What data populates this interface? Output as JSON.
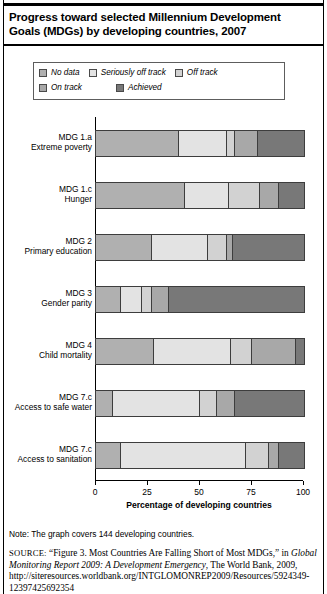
{
  "title": "Progress toward selected Millennium Development Goals (MDGs) by developing countries, 2007",
  "legend": {
    "items": [
      {
        "label": "No data",
        "color": "#b0b0b0"
      },
      {
        "label": "Seriously off track",
        "color": "#e3e3e3"
      },
      {
        "label": "Off track",
        "color": "#d2d2d2"
      },
      {
        "label": "On track",
        "color": "#a8a8a8"
      },
      {
        "label": "Achieved",
        "color": "#787878"
      }
    ]
  },
  "note": "Note: The graph covers 144 developing countries.",
  "source": {
    "prefix": "SOURCE:",
    "quote": "“Figure 3. Most Countries Are Falling Short of Most MDGs,” in ",
    "italic": "Global Monitoring Report 2009: A Development Emergency",
    "tail": ", The World Bank, 2009, http://siteresources.worldbank.org/INTGLOMONREP2009/Resources/5924349-12397425692354"
  },
  "chart_data": {
    "type": "bar",
    "orientation": "horizontal",
    "stacked": true,
    "stack_mode": "percent",
    "title": "Progress toward selected Millennium Development Goals (MDGs) by developing countries, 2007",
    "xlabel": "Percentage of developing countries",
    "ylabel": "",
    "xlim": [
      0,
      100
    ],
    "xticks": [
      0,
      25,
      50,
      75,
      100
    ],
    "grid": false,
    "legend_position": "top",
    "categories": [
      "MDG 1.a\nExtreme poverty",
      "MDG 1.c\nHunger",
      "MDG 2\nPrimary education",
      "MDG 3\nGender parity",
      "MDG 4\nChild mortality",
      "MDG 7.c\nAccess to safe water",
      "MDG 7.c\nAccess to sanitation"
    ],
    "category_lines": [
      [
        "MDG 1.a",
        "Extreme poverty"
      ],
      [
        "MDG 1.c",
        "Hunger"
      ],
      [
        "MDG 2",
        "Primary education"
      ],
      [
        "MDG 3",
        "Gender parity"
      ],
      [
        "MDG 4",
        "Child mortality"
      ],
      [
        "MDG 7.c",
        "Access to safe water"
      ],
      [
        "MDG 7.c",
        "Access to sanitation"
      ]
    ],
    "series": [
      {
        "name": "No data",
        "color": "#b0b0b0",
        "values": [
          40,
          43,
          27,
          12,
          28,
          8,
          12
        ]
      },
      {
        "name": "Seriously off track",
        "color": "#e3e3e3",
        "values": [
          23,
          21,
          27,
          10,
          37,
          42,
          60
        ]
      },
      {
        "name": "Off track",
        "color": "#d2d2d2",
        "values": [
          4,
          15,
          9,
          5,
          10,
          8,
          11
        ]
      },
      {
        "name": "On track",
        "color": "#a8a8a8",
        "values": [
          11,
          9,
          3,
          8,
          21,
          9,
          5
        ]
      },
      {
        "name": "Achieved",
        "color": "#787878",
        "values": [
          22,
          12,
          34,
          65,
          4,
          33,
          12
        ]
      }
    ]
  }
}
